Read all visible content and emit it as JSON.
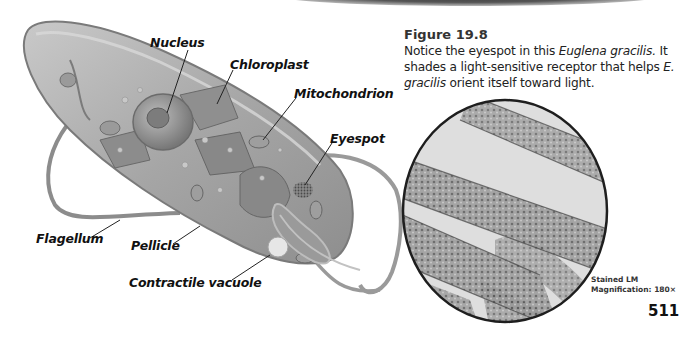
{
  "figure": {
    "number_label": "Figure 19.8",
    "caption_parts": [
      {
        "text": "Notice the eyespot in this ",
        "italic": false
      },
      {
        "text": "Euglena gracilis.",
        "italic": true
      },
      {
        "text": " It shades a light-sensitive receptor that helps ",
        "italic": false
      },
      {
        "text": "E. gracilis",
        "italic": true
      },
      {
        "text": " orient itself toward light.",
        "italic": false
      }
    ]
  },
  "diagram": {
    "labels": {
      "nucleus": "Nucleus",
      "chloroplast": "Chloroplast",
      "mitochondrion": "Mitochondrion",
      "eyespot": "Eyespot",
      "flagellum": "Flagellum",
      "pellicle": "Pellicle",
      "contractile_vacuole": "Contractile vacuole"
    }
  },
  "micrograph": {
    "stain_label": "Stained  LM",
    "magnification_label": "Magnification: 180×"
  },
  "page_number": "511",
  "colors": {
    "cell_fill": "#a9a9a9",
    "cell_outline": "#7a7a7a",
    "micrograph_bg": "#dcdcdc",
    "text": "#111111"
  }
}
